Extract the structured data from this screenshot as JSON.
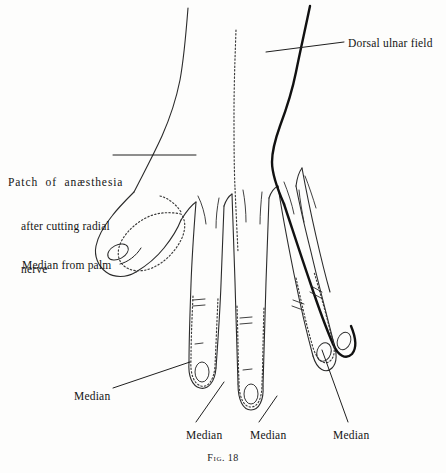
{
  "figure": {
    "caption_prefix": "Fig.",
    "caption_number": "18"
  },
  "labels": {
    "patch": {
      "line1": "Patch  of  anæsthesia",
      "line2": "after cutting radial",
      "line3": "nerve"
    },
    "dorsal_ulnar_field": "Dorsal ulnar field",
    "median_from_palm": "Median from palm",
    "median_thumb": "Median",
    "median_index": "Median",
    "median_middle": "Median",
    "median_ring": "Median"
  },
  "colors": {
    "background": "#fdfdfc",
    "ink": "#1a1a1a",
    "outline": "#2b2b2b",
    "heavy_outline": "#111111",
    "dotted_boundary": "#3a3a3a",
    "leader_line": "#1f1f1f"
  },
  "line_styles": {
    "outline_width": "1.1",
    "heavy_outline_width": "2.4",
    "dotted_dash_array": "1.4 2.2",
    "leader_width": "1.0"
  }
}
